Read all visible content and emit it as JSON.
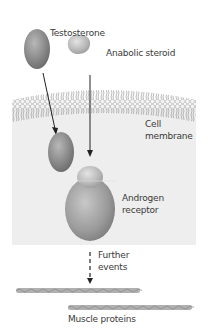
{
  "labels": {
    "testosterone": "Testosterone",
    "anabolic_steroid": "Anabolic steroid",
    "cell_membrane_line1": "Cell",
    "cell_membrane_line2": "membrane",
    "androgen_receptor_line1": "Androgen",
    "androgen_receptor_line2": "receptor",
    "further_events_line1": "Further",
    "further_events_line2": "events",
    "muscle_proteins": "Muscle proteins"
  },
  "colors": {
    "cell_interior": "#eeeeee",
    "molecule_gray": "#8a8a8a",
    "arrow": "#222222"
  }
}
